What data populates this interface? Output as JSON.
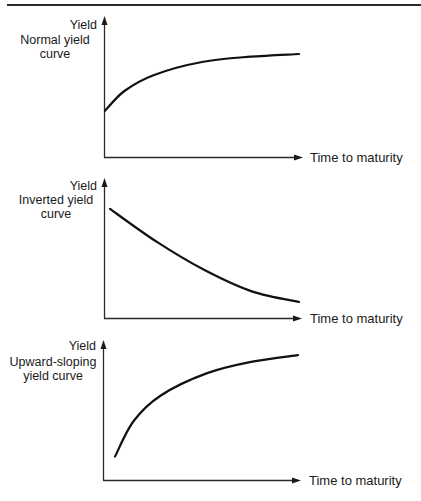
{
  "chart_data": [
    {
      "type": "line",
      "title": "Normal yield curve",
      "xlabel": "Time to maturity",
      "ylabel": "Yield",
      "grid": false,
      "x": [
        0,
        0.1,
        0.25,
        0.5,
        0.75,
        1.0
      ],
      "series": [
        {
          "name": "Normal yield curve",
          "values": [
            0.35,
            0.5,
            0.62,
            0.72,
            0.76,
            0.78
          ]
        }
      ],
      "xlim": [
        0,
        1
      ],
      "ylim": [
        0,
        1
      ]
    },
    {
      "type": "line",
      "title": "Inverted yield curve",
      "xlabel": "Time to maturity",
      "ylabel": "Yield",
      "grid": false,
      "x": [
        0,
        0.25,
        0.5,
        0.75,
        1.0
      ],
      "series": [
        {
          "name": "Inverted yield curve",
          "values": [
            0.82,
            0.57,
            0.36,
            0.2,
            0.12
          ]
        }
      ],
      "xlim": [
        0,
        1
      ],
      "ylim": [
        0,
        1
      ]
    },
    {
      "type": "line",
      "title": "Upward-sloping yield curve",
      "xlabel": "Time to maturity",
      "ylabel": "Yield",
      "grid": false,
      "x": [
        0,
        0.1,
        0.25,
        0.5,
        0.75,
        1.0
      ],
      "series": [
        {
          "name": "Upward-sloping yield curve",
          "values": [
            0.18,
            0.45,
            0.65,
            0.82,
            0.91,
            0.96
          ]
        }
      ],
      "xlim": [
        0,
        1
      ],
      "ylim": [
        0,
        1
      ]
    }
  ],
  "panels": [
    {
      "y_label": "Yield",
      "curve_label_line1": "Normal yield",
      "curve_label_line2": "curve",
      "x_label": "Time to maturity"
    },
    {
      "y_label": "Yield",
      "curve_label_line1": "Inverted yield",
      "curve_label_line2": "curve",
      "x_label": "Time to maturity"
    },
    {
      "y_label": "Yield",
      "curve_label_line1": "Upward-sloping",
      "curve_label_line2": "yield curve",
      "x_label": "Time to maturity"
    }
  ],
  "colors": {
    "ink": "#1a1a1a",
    "background": "#ffffff"
  }
}
